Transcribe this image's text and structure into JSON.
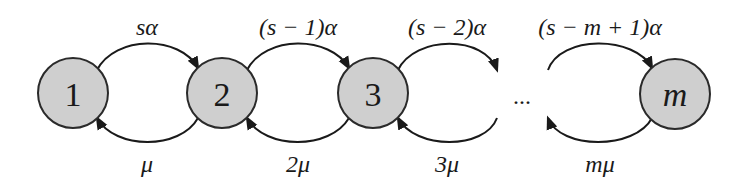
{
  "diagram": {
    "type": "birth-death chain",
    "nodes": [
      {
        "id": "1",
        "label": "1",
        "italic": false
      },
      {
        "id": "2",
        "label": "2",
        "italic": false
      },
      {
        "id": "3",
        "label": "3",
        "italic": false
      },
      {
        "id": "m",
        "label": "m",
        "italic": true
      }
    ],
    "ellipsis": "...",
    "forward_edges": [
      {
        "from": "1",
        "to": "2",
        "label": "sα"
      },
      {
        "from": "2",
        "to": "3",
        "label": "(s − 1)α"
      },
      {
        "from": "3",
        "to": "...",
        "label": "(s − 2)α"
      },
      {
        "from": "...",
        "to": "m",
        "label": "(s − m + 1)α"
      }
    ],
    "backward_edges": [
      {
        "from": "2",
        "to": "1",
        "label": "μ"
      },
      {
        "from": "3",
        "to": "2",
        "label": "2μ"
      },
      {
        "from": "...",
        "to": "3",
        "label": "3μ"
      },
      {
        "from": "m",
        "to": "...",
        "label": "mμ"
      }
    ],
    "colors": {
      "node_fill": "#cfcfcf",
      "stroke": "#1a1a1a"
    }
  }
}
